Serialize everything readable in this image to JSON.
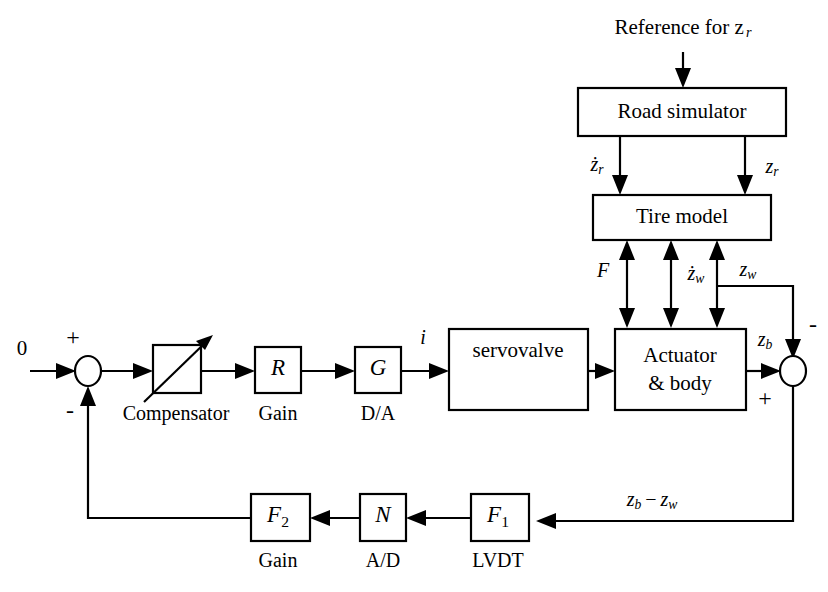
{
  "diagram": {
    "blocks": [
      {
        "id": "road_simulator",
        "label": "Road simulator",
        "caption": ""
      },
      {
        "id": "tire_model",
        "label": "Tire model",
        "caption": ""
      },
      {
        "id": "compensator",
        "label": "",
        "caption": "Compensator"
      },
      {
        "id": "gain_r",
        "label": "R",
        "caption": "Gain"
      },
      {
        "id": "da_g",
        "label": "G",
        "caption": "D/A"
      },
      {
        "id": "servovalve",
        "label": "servovalve",
        "caption": ""
      },
      {
        "id": "actuator_body",
        "label_line1": "Actuator",
        "label_line2": "& body",
        "caption": ""
      },
      {
        "id": "gain_f2",
        "label": "F",
        "sub": "2",
        "caption": "Gain"
      },
      {
        "id": "ad_n",
        "label": "N",
        "caption": "A/D"
      },
      {
        "id": "lvdt_f1",
        "label": "F",
        "sub": "1",
        "caption": "LVDT"
      }
    ],
    "signals": {
      "reference": "Reference for z",
      "reference_sub": "r",
      "zr_dot_base": "z",
      "zr_dot_sub": "r",
      "zr_base": "z",
      "zr_sub": "r",
      "force": "F",
      "zw_dot_base": "z",
      "zw_dot_sub": "w",
      "zw_base": "z",
      "zw_sub": "w",
      "zb_base": "z",
      "zb_sub": "b",
      "current": "i",
      "input_zero": "0",
      "error_expr_a": "z",
      "error_expr_a_sub": "b",
      "error_expr_minus": "−",
      "error_expr_b": "z",
      "error_expr_b_sub": "w"
    },
    "signs": {
      "left_sum_top": "+",
      "left_sum_bottom": "-",
      "right_sum_top": "-",
      "right_sum_bottom": "+"
    },
    "colors": {
      "line": "#000000",
      "background": "#ffffff",
      "text": "#000000"
    }
  }
}
